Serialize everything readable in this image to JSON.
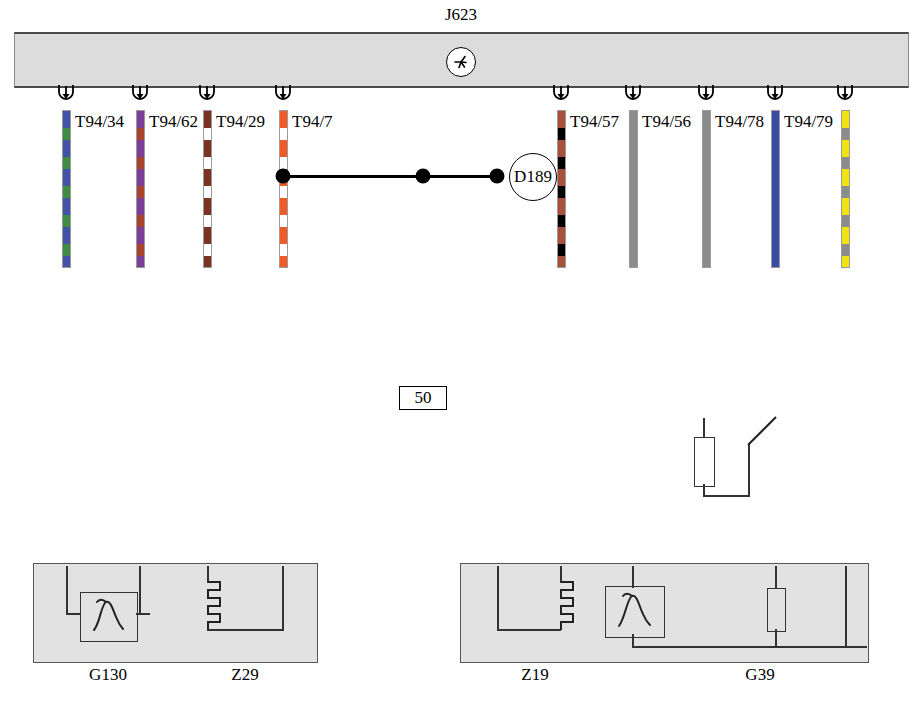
{
  "diagram": {
    "title": "J623",
    "module_symbol": "star-in-circle",
    "splice": {
      "label": "D189"
    },
    "fuse": {
      "label": "50"
    }
  },
  "ecu_terminals": [
    {
      "label": "T94/34"
    },
    {
      "label": "T94/62"
    },
    {
      "label": "T94/29"
    },
    {
      "label": "T94/7"
    },
    {
      "label": "T94/57"
    },
    {
      "label": "T94/56"
    },
    {
      "label": "T94/78"
    },
    {
      "label": "T94/79"
    }
  ],
  "wires": [
    {
      "id": "w1",
      "gauge": "0.35",
      "color_code": "bl/gn",
      "x": 66,
      "base": "#4253a8",
      "stripe": "#3f8c43",
      "pattern": "striped"
    },
    {
      "id": "w2",
      "gauge": "0.35",
      "color_code": "vi/br",
      "x": 140,
      "base": "#7b3f98",
      "stripe": "#a8442c",
      "pattern": "striped"
    },
    {
      "id": "w3",
      "gauge": "1.0",
      "color_code": "br/ws",
      "x": 207,
      "base": "#7b3326",
      "stripe": "#ffffff",
      "pattern": "striped"
    },
    {
      "id": "w4",
      "gauge": "1.0",
      "color_code": "rt/ws",
      "x": 283,
      "base": "#ef5a28",
      "stripe": "#ffffff",
      "pattern": "striped"
    },
    {
      "id": "w5",
      "gauge": "1.5",
      "color_code": "rt/ws",
      "x": 423,
      "base": "#ef5a28",
      "stripe": "#ffffff",
      "pattern": "striped"
    },
    {
      "id": "w6",
      "gauge": "1.0",
      "color_code": "rt/ws",
      "x": 497,
      "base": "#ef5a28",
      "stripe": "#ffffff",
      "pattern": "striped"
    },
    {
      "id": "w7",
      "gauge": "1.0",
      "color_code": "br/sw",
      "x": 561,
      "base": "#a8503c",
      "stripe": "#000000",
      "pattern": "striped"
    },
    {
      "id": "w8",
      "gauge": "0.5",
      "color_code": "gr",
      "x": 633,
      "base": "#8c8c8c",
      "stripe": "#8c8c8c",
      "pattern": "solid"
    },
    {
      "id": "w9",
      "gauge": "0.5",
      "color_code": "gr",
      "x": 706,
      "base": "#8c8c8c",
      "stripe": "#8c8c8c",
      "pattern": "solid"
    },
    {
      "id": "w10",
      "gauge": "0.5",
      "color_code": "bl",
      "x": 775,
      "base": "#3b4aa5",
      "stripe": "#3b4aa5",
      "pattern": "solid"
    },
    {
      "id": "w11",
      "gauge": "0.5",
      "color_code": "ge/gr",
      "x": 845,
      "base": "#f2e310",
      "stripe": "#8c8c8c",
      "pattern": "striped"
    }
  ],
  "inline_connectors": [
    {
      "label": "T4no/3",
      "x": 66
    },
    {
      "label": "T4no/4",
      "x": 140
    },
    {
      "label": "T4no/2",
      "x": 207
    },
    {
      "label": "T4no/1",
      "x": 283
    },
    {
      "label": "T6w/4",
      "x": 497
    },
    {
      "label": "T6w/3",
      "x": 561
    },
    {
      "label": "T6w/6",
      "x": 633
    },
    {
      "label": "T6w/5",
      "x": 706
    },
    {
      "label": "T6w/1",
      "x": 775
    },
    {
      "label": "T6w/2",
      "x": 845
    }
  ],
  "components": [
    {
      "label": "G130",
      "type": "lambda-sensor",
      "x": 108
    },
    {
      "label": "Z29",
      "type": "heater-element",
      "x": 245
    },
    {
      "label": "Z19",
      "type": "heater-element",
      "x": 535
    },
    {
      "label": "G39",
      "type": "lambda-sensor",
      "x": 760
    }
  ]
}
